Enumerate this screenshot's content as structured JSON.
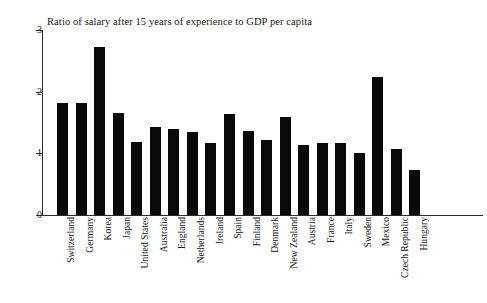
{
  "chart_data": {
    "type": "bar",
    "title": "Ratio of salary after 15 years of experience to GDP per capita",
    "xlabel": "",
    "ylabel": "",
    "ylim": [
      0,
      3
    ],
    "yticks": [
      0,
      1,
      2,
      3
    ],
    "ytick_labels": [
      "0",
      "1",
      "2",
      "3"
    ],
    "grid": false,
    "legend": false,
    "orientation": "vertical",
    "bar_color": "#0a0a0a",
    "categories": [
      "Switzerland",
      "Germany",
      "Korea",
      "Japan",
      "United States",
      "Australia",
      "England",
      "Netherlands",
      "Ireland",
      "Spain",
      "Finland",
      "Denmark",
      "New Zealand",
      "Austria",
      "France",
      "Italy",
      "Sweden",
      "Mexico",
      "Czech Republic",
      "Hungary"
    ],
    "values": [
      1.82,
      1.81,
      2.72,
      1.65,
      1.18,
      1.43,
      1.4,
      1.34,
      1.16,
      1.64,
      1.37,
      1.21,
      1.59,
      1.14,
      1.17,
      1.17,
      1.0,
      2.24,
      1.07,
      0.73
    ]
  }
}
